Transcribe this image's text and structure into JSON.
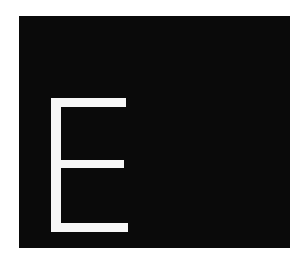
{
  "tile": {
    "letter": "E",
    "background_color": "#0a0a0a",
    "letter_color": "#f7f7f7"
  }
}
